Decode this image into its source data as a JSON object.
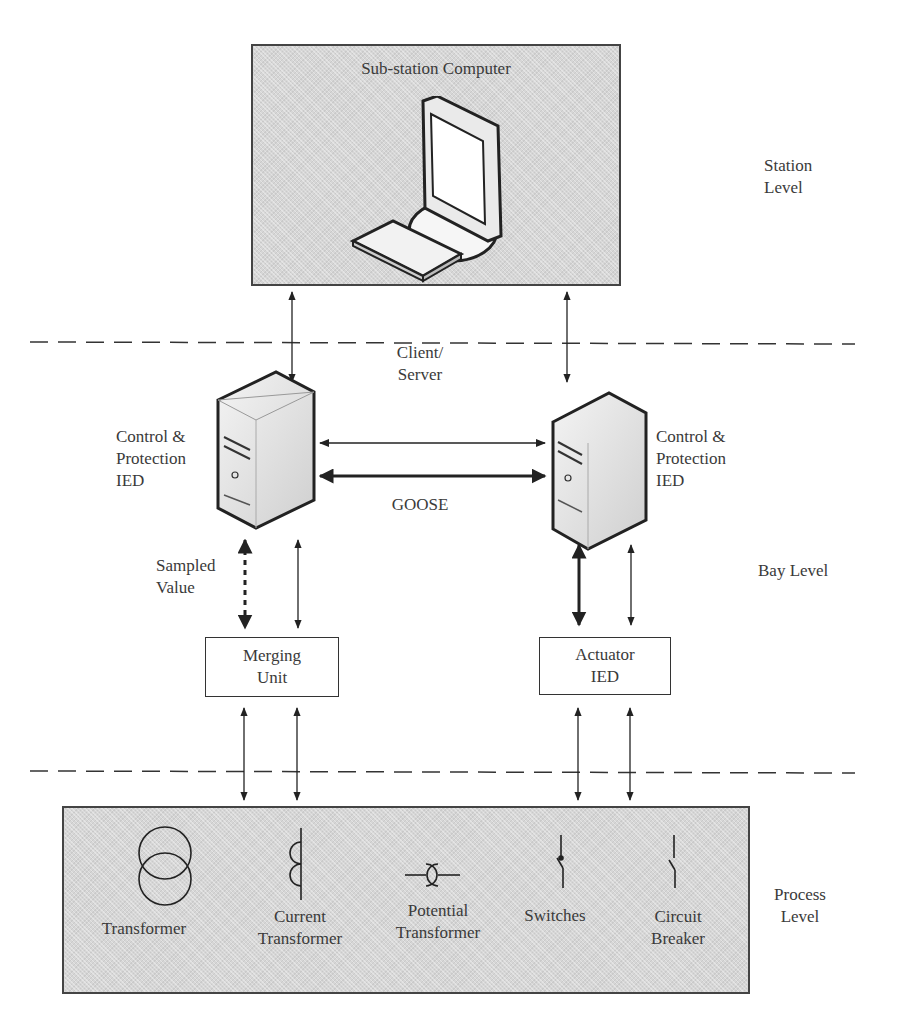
{
  "diagram": {
    "levels": {
      "station": "Station\nLevel",
      "station_line1": "Station",
      "station_line2": "Level",
      "bay": "Bay Level",
      "process_line1": "Process",
      "process_line2": "Level"
    },
    "station_box": {
      "title": "Sub-station Computer"
    },
    "links": {
      "client_server_line1": "Client/",
      "client_server_line2": "Server",
      "goose": "GOOSE",
      "sampled_value_line1": "Sampled",
      "sampled_value_line2": "Value"
    },
    "ied_left": {
      "line1": "Control &",
      "line2": "Protection",
      "line3": "IED"
    },
    "ied_right": {
      "line1": "Control &",
      "line2": "Protection",
      "line3": "IED"
    },
    "merging_unit": {
      "line1": "Merging",
      "line2": "Unit"
    },
    "actuator_ied": {
      "line1": "Actuator",
      "line2": "IED"
    },
    "process_devices": [
      {
        "icon": "transformer-icon",
        "line1": "Transformer",
        "line2": ""
      },
      {
        "icon": "current-transformer-icon",
        "line1": "Current",
        "line2": "Transformer"
      },
      {
        "icon": "potential-transformer-icon",
        "line1": "Potential",
        "line2": "Transformer"
      },
      {
        "icon": "switch-icon",
        "line1": "Switches",
        "line2": ""
      },
      {
        "icon": "circuit-breaker-icon",
        "line1": "Circuit",
        "line2": "Breaker"
      }
    ],
    "colors": {
      "box_fill": "#d6d6d6",
      "stroke": "#333333",
      "text": "#3a3a3a"
    }
  }
}
